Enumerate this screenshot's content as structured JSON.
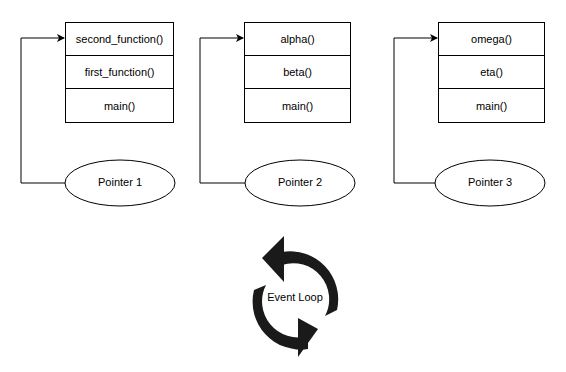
{
  "diagram": {
    "stacks": [
      {
        "frames": [
          "second_function()",
          "first_function()",
          "main()"
        ],
        "pointer": "Pointer 1"
      },
      {
        "frames": [
          "alpha()",
          "beta()",
          "main()"
        ],
        "pointer": "Pointer 2"
      },
      {
        "frames": [
          "omega()",
          "eta()",
          "main()"
        ],
        "pointer": "Pointer 3"
      }
    ],
    "event_loop": {
      "label": "Event Loop",
      "icon": "refresh-cycle-icon"
    },
    "colors": {
      "stroke": "#000000",
      "background": "#ffffff",
      "arrow_fill": "#1a1a1a"
    }
  }
}
